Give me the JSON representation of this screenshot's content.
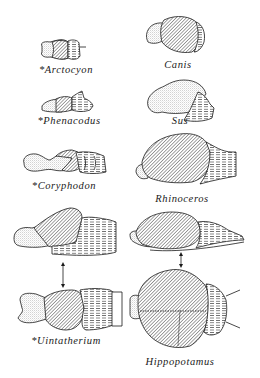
{
  "figure": {
    "title": "",
    "extinct_marker": "*",
    "colors": {
      "ink": "#1a1a1a",
      "background": "#ffffff"
    },
    "left_column": [
      {
        "id": "arctocyon",
        "label": "*Arctocyon"
      },
      {
        "id": "phenacodus",
        "label": "*Phenacodus"
      },
      {
        "id": "coryphodon",
        "label": "*Coryphodon"
      },
      {
        "id": "uintatherium",
        "label": "*Uintatherium"
      }
    ],
    "right_column": [
      {
        "id": "canis",
        "label": "Canis"
      },
      {
        "id": "sus",
        "label": "Sus"
      },
      {
        "id": "rhinoceros",
        "label": "Rhinoceros"
      },
      {
        "id": "hippopotamus",
        "label": "Hippopotamus"
      }
    ],
    "legend_shading": {
      "olfactory_bulb": "stippled",
      "cerebrum": "diagonal-hatched",
      "cerebellum_brainstem": "horizontal-dashed"
    }
  }
}
